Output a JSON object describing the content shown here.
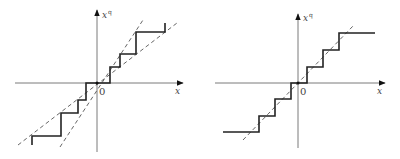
{
  "panels": [
    {
      "name": "mid-tread-quantizer",
      "origin": [
        97,
        83
      ],
      "x_axis": {
        "from": [
          15,
          83
        ],
        "to": [
          183,
          83
        ],
        "label": "x"
      },
      "y_axis": {
        "from": [
          97,
          152
        ],
        "to": [
          97,
          10
        ],
        "label": "x",
        "label_sup": "q"
      },
      "origin_label": "0",
      "staircase": "M32,145 L32,136 L61,136 L61,113 L78,113 L78,100 L86,100 L86,83 L110,83 L110,67 L120,67 L120,54 L136,54 L136,32 L165,32 L165,23",
      "dashed_lines": [
        {
          "x1": 18,
          "y1": 145,
          "x2": 177,
          "y2": 23
        },
        {
          "x1": 60,
          "y1": 147,
          "x2": 143,
          "y2": 20
        }
      ]
    },
    {
      "name": "mid-rise-quantizer",
      "origin": [
        298,
        83
      ],
      "x_axis": {
        "from": [
          215,
          83
        ],
        "to": [
          385,
          83
        ],
        "label": "x"
      },
      "y_axis": {
        "from": [
          298,
          148
        ],
        "to": [
          298,
          14
        ],
        "label": "x",
        "label_sup": "q"
      },
      "origin_label": "0",
      "staircase": "M223,132 L259,132 L259,116 L275,116 L275,99 L291,99 L291,83 L307,83 L307,67 L323,67 L323,50 L339,50 L339,33 L375,33",
      "dashed_lines": [
        {
          "x1": 243,
          "y1": 140,
          "x2": 354,
          "y2": 25
        }
      ]
    }
  ]
}
